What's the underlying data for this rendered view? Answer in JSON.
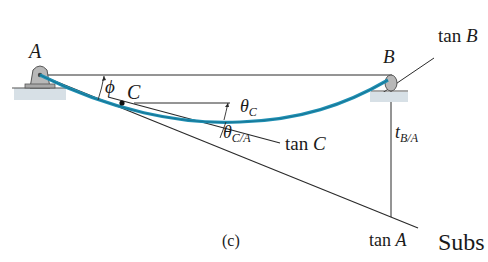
{
  "diagram": {
    "caption": "(c)",
    "points": {
      "A": "A",
      "B": "B",
      "C": "C"
    },
    "tangents": {
      "tan_A_prefix": "tan ",
      "tan_A_var": "A",
      "tan_B_prefix": "tan ",
      "tan_B_var": "B",
      "tan_C_prefix": "tan ",
      "tan_C_var": "C"
    },
    "angles": {
      "phi": "ϕ",
      "theta_C_main": "θ",
      "theta_C_sub": "C",
      "theta_CA_main": "θ",
      "theta_CA_sub": "C/A"
    },
    "deviation": {
      "t_main": "t",
      "t_sub": "B/A"
    },
    "cut_text": "Subs",
    "colors": {
      "beam": "#1f8fb3",
      "beam_dark": "#0f5f7a",
      "lines": "#2a2a2a",
      "support": "#9a9a9a",
      "ground": "#c9d3da"
    }
  }
}
